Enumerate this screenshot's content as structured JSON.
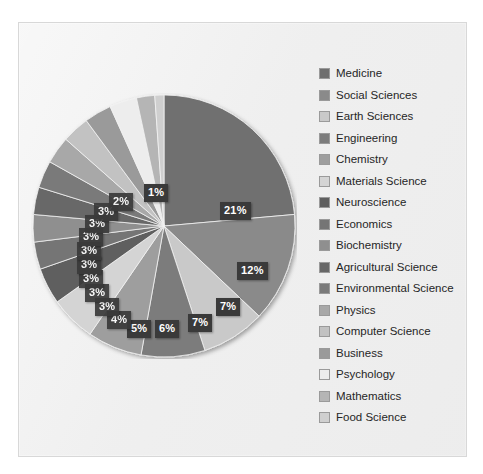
{
  "chart_data": {
    "type": "pie",
    "title": "",
    "legend_position": "right",
    "categories": [
      "Medicine",
      "Social Sciences",
      "Earth Sciences",
      "Engineering",
      "Chemistry",
      "Materials Science",
      "Neuroscience",
      "Economics",
      "Biochemistry",
      "Agricultural Science",
      "Environmental Science",
      "Physics",
      "Computer Science",
      "Business",
      "Psychology",
      "Mathematics",
      "Food Science"
    ],
    "values": [
      21,
      12,
      7,
      7,
      6,
      5,
      4,
      3,
      3,
      3,
      3,
      3,
      3,
      3,
      3,
      2,
      1
    ],
    "value_unit": "%",
    "data_labels": [
      "21%",
      "12%",
      "7%",
      "7%",
      "6%",
      "5%",
      "4%",
      "3%",
      "3%",
      "3%",
      "3%",
      "3%",
      "3%",
      "3%",
      "3%",
      "2%",
      "1%"
    ],
    "slice_colors": [
      "#6f6f6f",
      "#8a8a8a",
      "#c9c9c9",
      "#7c7c7c",
      "#9e9e9e",
      "#d4d4d4",
      "#5f5f5f",
      "#757575",
      "#8f8f8f",
      "#676767",
      "#7a7a7a",
      "#a8a8a8",
      "#c2c2c2",
      "#9a9a9a",
      "#ededed",
      "#b5b5b5",
      "#cfcfcf"
    ],
    "start_angle_deg": 0,
    "direction": "clockwise"
  },
  "legend": {
    "items": [
      {
        "label": "Medicine",
        "color": "#6f6f6f"
      },
      {
        "label": "Social Sciences",
        "color": "#8a8a8a"
      },
      {
        "label": "Earth Sciences",
        "color": "#c9c9c9"
      },
      {
        "label": "Engineering",
        "color": "#7c7c7c"
      },
      {
        "label": "Chemistry",
        "color": "#9e9e9e"
      },
      {
        "label": "Materials Science",
        "color": "#d4d4d4"
      },
      {
        "label": "Neuroscience",
        "color": "#5f5f5f"
      },
      {
        "label": "Economics",
        "color": "#757575"
      },
      {
        "label": "Biochemistry",
        "color": "#8f8f8f"
      },
      {
        "label": "Agricultural Science",
        "color": "#676767"
      },
      {
        "label": "Environmental Science",
        "color": "#7a7a7a"
      },
      {
        "label": "Physics",
        "color": "#a8a8a8"
      },
      {
        "label": "Computer Science",
        "color": "#c2c2c2"
      },
      {
        "label": "Business",
        "color": "#9a9a9a"
      },
      {
        "label": "Psychology",
        "color": "#ededed"
      },
      {
        "label": "Mathematics",
        "color": "#b5b5b5"
      },
      {
        "label": "Food Science",
        "color": "#cfcfcf"
      }
    ]
  },
  "labels": {
    "l0": "21%",
    "l1": "12%",
    "l2": "7%",
    "l3": "7%",
    "l4": "6%",
    "l5": "5%",
    "l6": "4%",
    "l7": "3%",
    "l8": "3%",
    "l9": "3%",
    "l10": "3%",
    "l11": "3%",
    "l12": "3%",
    "l13": "3%",
    "l14": "3%",
    "l15": "2%",
    "l16": "1%"
  }
}
